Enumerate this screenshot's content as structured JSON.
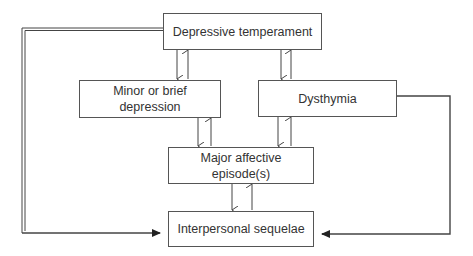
{
  "diagram": {
    "nodes": {
      "depressive_temperament": "Depressive temperament",
      "minor_depression_line1": "Minor or brief",
      "minor_depression_line2": "depression",
      "dysthymia": "Dysthymia",
      "major_affective_line1": "Major affective",
      "major_affective_line2": "episode(s)",
      "interpersonal_sequelae": "Interpersonal sequelae"
    },
    "edges": [
      {
        "from": "Depressive temperament",
        "to": "Minor or brief depression",
        "bidirectional": true
      },
      {
        "from": "Depressive temperament",
        "to": "Dysthymia",
        "bidirectional": true
      },
      {
        "from": "Minor or brief depression",
        "to": "Major affective episode(s)",
        "bidirectional": true
      },
      {
        "from": "Dysthymia",
        "to": "Major affective episode(s)",
        "bidirectional": true
      },
      {
        "from": "Major affective episode(s)",
        "to": "Interpersonal sequelae",
        "bidirectional": true
      },
      {
        "from": "Depressive temperament",
        "to": "Interpersonal sequelae",
        "bidirectional": false,
        "style": "double line"
      },
      {
        "from": "Dysthymia",
        "to": "Interpersonal sequelae",
        "bidirectional": false
      }
    ]
  }
}
